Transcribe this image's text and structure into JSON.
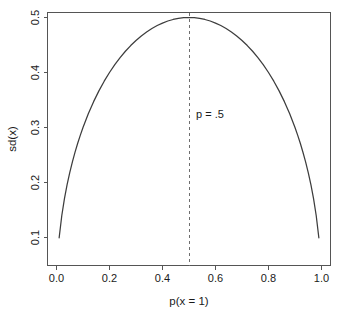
{
  "figure": {
    "width": 341,
    "height": 315,
    "background": "#ffffff",
    "curve_color": "#3d3d3d",
    "axis_color": "#555555",
    "reference_line_color": "#6e6e6e",
    "text_color": "#1a1a1a"
  },
  "chart_data": {
    "type": "line",
    "title": "",
    "subtitle": "",
    "xlabel": "p(x = 1)",
    "ylabel": "sd(x)",
    "xlim": [
      0.0,
      1.0
    ],
    "ylim": [
      0.0995,
      0.5
    ],
    "grid": false,
    "legend": null,
    "x_ticks": [
      0.0,
      0.2,
      0.4,
      0.6,
      0.8,
      1.0
    ],
    "x_tick_labels": [
      "0.0",
      "0.2",
      "0.4",
      "0.6",
      "0.8",
      "1.0"
    ],
    "y_ticks": [
      0.1,
      0.2,
      0.3,
      0.4,
      0.5
    ],
    "y_tick_labels": [
      "0.1",
      "0.2",
      "0.3",
      "0.4",
      "0.5"
    ],
    "series": [
      {
        "name": "sd(x) = sqrt(p(1-p))",
        "x": [
          0.01,
          0.02,
          0.03,
          0.04,
          0.05,
          0.06,
          0.07,
          0.08,
          0.09,
          0.1,
          0.12,
          0.14,
          0.16,
          0.18,
          0.2,
          0.22,
          0.24,
          0.26,
          0.28,
          0.3,
          0.32,
          0.34,
          0.36,
          0.38,
          0.4,
          0.42,
          0.44,
          0.46,
          0.48,
          0.5,
          0.52,
          0.54,
          0.56,
          0.58,
          0.6,
          0.62,
          0.64,
          0.66,
          0.68,
          0.7,
          0.72,
          0.74,
          0.76,
          0.78,
          0.8,
          0.82,
          0.84,
          0.86,
          0.88,
          0.9,
          0.91,
          0.92,
          0.93,
          0.94,
          0.95,
          0.96,
          0.97,
          0.98,
          0.99
        ],
        "y": [
          0.0995,
          0.14,
          0.1706,
          0.196,
          0.2179,
          0.2375,
          0.2551,
          0.2713,
          0.2862,
          0.3,
          0.325,
          0.347,
          0.3666,
          0.3842,
          0.4,
          0.4142,
          0.4271,
          0.4386,
          0.449,
          0.4583,
          0.4665,
          0.4737,
          0.48,
          0.4854,
          0.4899,
          0.4936,
          0.4964,
          0.4984,
          0.4996,
          0.5,
          0.4996,
          0.4984,
          0.4964,
          0.4936,
          0.4899,
          0.4854,
          0.48,
          0.4737,
          0.4665,
          0.4583,
          0.449,
          0.4386,
          0.4271,
          0.4142,
          0.4,
          0.3842,
          0.3666,
          0.347,
          0.325,
          0.3,
          0.2862,
          0.2713,
          0.2551,
          0.2375,
          0.2179,
          0.196,
          0.1706,
          0.14,
          0.0995
        ]
      }
    ],
    "annotations": [
      {
        "name": "p-half-reference",
        "text": "p = .5",
        "x": 0.5,
        "y": 0.318,
        "line_style": "dashed",
        "orientation": "vertical"
      }
    ]
  }
}
